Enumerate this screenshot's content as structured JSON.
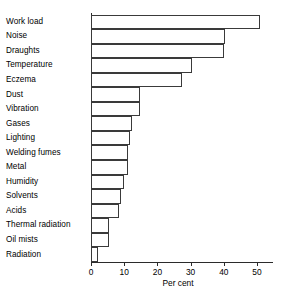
{
  "chart_data": {
    "type": "bar",
    "orientation": "horizontal",
    "title": "",
    "xlabel": "Per cent",
    "ylabel": "",
    "xlim": [
      0,
      55
    ],
    "xticks": [
      0,
      10,
      20,
      30,
      40,
      50
    ],
    "xtick_labels": [
      "0",
      "10",
      "20",
      "30",
      "40",
      "50"
    ],
    "grid": false,
    "legend": false,
    "bar_style": {
      "fill": "#ffffff",
      "edge": "#3a3a3a",
      "gap": 0
    },
    "categories": [
      "Work load",
      "Noise",
      "Draughts",
      "Temperature",
      "Eczema",
      "Dust",
      "Vibration",
      "Gases",
      "Lighting",
      "Welding fumes",
      "Metal",
      "Humidity",
      "Solvents",
      "Acids",
      "Thermal radiation",
      "Oil mists",
      "Radiation"
    ],
    "values": [
      51,
      40.5,
      40,
      30.5,
      27.5,
      14.8,
      14.8,
      12.3,
      11.7,
      11,
      11,
      10,
      9,
      8.5,
      5.5,
      5.5,
      2
    ]
  },
  "axis": {
    "x_title": "Per cent"
  }
}
